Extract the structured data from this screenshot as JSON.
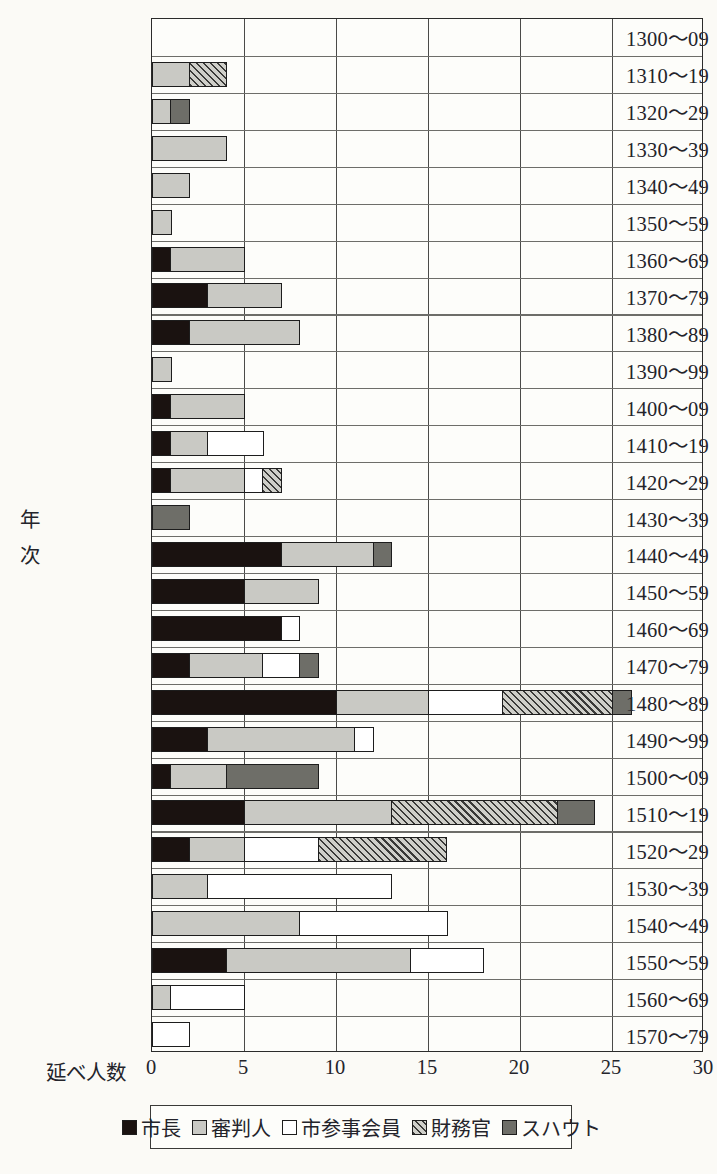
{
  "axis": {
    "x_caption": "延べ人数",
    "y_title": "年次",
    "y_title_chars": [
      "年",
      "次"
    ],
    "xticks": [
      "0",
      "5",
      "10",
      "15",
      "20",
      "25",
      "30"
    ]
  },
  "legend": {
    "items": [
      {
        "label": "市長",
        "key": "shicho",
        "swatch": "solid-black",
        "color": "#1a1210"
      },
      {
        "label": "審判人",
        "key": "shinpan",
        "swatch": "solid-lightgray",
        "color": "#c9c9c4"
      },
      {
        "label": "市参事会員",
        "key": "sanji",
        "swatch": "outline-white",
        "color": "#ffffff"
      },
      {
        "label": "財務官",
        "key": "zaimu",
        "swatch": "diagonal-hatch",
        "color": "#cfcfc9"
      },
      {
        "label": "スハウト",
        "key": "schout",
        "swatch": "solid-darkgray",
        "color": "#6e6e68"
      }
    ]
  },
  "chart_data": {
    "type": "bar",
    "orientation": "horizontal",
    "stacked": true,
    "title": "",
    "xlabel": "延べ人数",
    "ylabel": "年次",
    "xlim": [
      0,
      30
    ],
    "xtick_step": 5,
    "grid": "vertical",
    "legend_position": "bottom",
    "categories": [
      "1300～09",
      "1310～19",
      "1320～29",
      "1330～39",
      "1340～49",
      "1350～59",
      "1360～69",
      "1370～79",
      "1380～89",
      "1390～99",
      "1400～09",
      "1410～19",
      "1420～29",
      "1430～39",
      "1440～49",
      "1450～59",
      "1460～69",
      "1470～79",
      "1480～89",
      "1490～99",
      "1500～09",
      "1510～19",
      "1520～29",
      "1530～39",
      "1540～49",
      "1550～59",
      "1560～69",
      "1570～79"
    ],
    "series": [
      {
        "name": "市長",
        "key": "shicho",
        "values": [
          0,
          0,
          0,
          0,
          0,
          0,
          1,
          3,
          2,
          0,
          1,
          1,
          1,
          0,
          7,
          5,
          7,
          2,
          10,
          3,
          1,
          5,
          2,
          0,
          0,
          4,
          0,
          0
        ]
      },
      {
        "name": "審判人",
        "key": "shinpan",
        "values": [
          0,
          2,
          1,
          4,
          2,
          1,
          4,
          4,
          6,
          1,
          4,
          2,
          4,
          0,
          5,
          4,
          0,
          4,
          5,
          8,
          3,
          8,
          3,
          3,
          8,
          10,
          1,
          0
        ]
      },
      {
        "name": "市参事会員",
        "key": "sanji",
        "values": [
          0,
          0,
          0,
          0,
          0,
          0,
          0,
          0,
          0,
          0,
          0,
          3,
          1,
          0,
          0,
          0,
          1,
          2,
          4,
          1,
          0,
          0,
          4,
          10,
          8,
          4,
          4,
          2
        ]
      },
      {
        "name": "財務官",
        "key": "zaimu",
        "values": [
          0,
          2,
          0,
          0,
          0,
          0,
          0,
          0,
          0,
          0,
          0,
          0,
          1,
          0,
          0,
          0,
          0,
          0,
          6,
          0,
          0,
          9,
          7,
          0,
          0,
          0,
          0,
          0
        ]
      },
      {
        "name": "スハウト",
        "key": "schout",
        "values": [
          0,
          0,
          1,
          0,
          0,
          0,
          0,
          0,
          0,
          0,
          0,
          0,
          0,
          2,
          1,
          0,
          0,
          1,
          1,
          0,
          5,
          2,
          0,
          0,
          0,
          0,
          0,
          0
        ]
      }
    ],
    "totals": [
      0,
      4,
      2,
      4,
      2,
      1,
      5,
      7,
      8,
      1,
      5,
      6,
      7,
      2,
      13,
      9,
      8,
      9,
      26,
      12,
      9,
      24,
      16,
      13,
      16,
      18,
      5,
      2
    ]
  }
}
